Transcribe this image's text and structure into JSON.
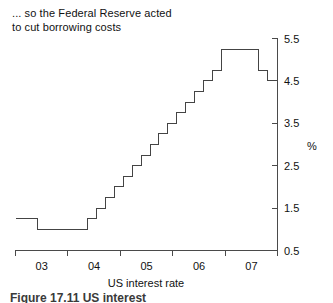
{
  "figure": {
    "title_line1": "... so the Federal Reserve acted",
    "title_line2": "to cut borrowing costs",
    "bottom_caption_fragment": "Figure 17.11   US interest"
  },
  "chart_data": {
    "type": "line",
    "step": true,
    "title": "... so the Federal Reserve acted to cut borrowing costs",
    "xlabel": "US interest rate",
    "ylabel": "%",
    "unit": "%",
    "xlim": [
      2002.5,
      2007.75
    ],
    "ylim": [
      0.5,
      5.5
    ],
    "xticks": [
      2002.5,
      2003.5,
      2004.5,
      2005.5,
      2006.5,
      2007.5
    ],
    "xtick_labels": [
      "03",
      "04",
      "05",
      "06",
      "07"
    ],
    "xtick_label_positions": [
      2003.0,
      2004.0,
      2005.0,
      2006.0,
      2007.0
    ],
    "yticks": [
      0.5,
      1.5,
      2.5,
      3.5,
      4.5,
      5.5
    ],
    "ytick_labels": [
      "0.5",
      "1.5",
      "2.5",
      "3.5",
      "4.5",
      "5.5"
    ],
    "grid": false,
    "legend": false,
    "series": [
      {
        "name": "US interest rate",
        "x": [
          2002.5,
          2002.95,
          2002.95,
          2003.95,
          2003.95,
          2004.13,
          2004.13,
          2004.31,
          2004.31,
          2004.48,
          2004.48,
          2004.66,
          2004.66,
          2004.84,
          2004.84,
          2005.02,
          2005.02,
          2005.2,
          2005.2,
          2005.37,
          2005.37,
          2005.55,
          2005.55,
          2005.73,
          2005.73,
          2005.91,
          2005.91,
          2006.09,
          2006.09,
          2006.26,
          2006.26,
          2006.44,
          2006.44,
          2006.62,
          2006.62,
          2007.36,
          2007.36,
          2007.55,
          2007.55,
          2007.72
        ],
        "y": [
          1.25,
          1.25,
          1.0,
          1.0,
          1.25,
          1.25,
          1.5,
          1.5,
          1.75,
          1.75,
          2.0,
          2.0,
          2.25,
          2.25,
          2.5,
          2.5,
          2.75,
          2.75,
          3.0,
          3.0,
          3.25,
          3.25,
          3.5,
          3.5,
          3.75,
          3.75,
          4.0,
          4.0,
          4.25,
          4.25,
          4.5,
          4.5,
          4.75,
          4.75,
          5.25,
          5.25,
          4.75,
          4.75,
          4.5,
          4.5
        ],
        "levels_description": [
          {
            "period": "early 2003",
            "rate": 1.25
          },
          {
            "period": "mid 2003 - mid 2004",
            "rate": 1.0
          },
          {
            "period": "2004 step increases",
            "rate_from": 1.25,
            "rate_to": 2.25
          },
          {
            "period": "2005 step increases",
            "rate_from": 2.5,
            "rate_to": 4.25
          },
          {
            "period": "2006 step increases",
            "rate_from": 4.5,
            "rate_to": 5.25
          },
          {
            "period": "mid 2006 - mid 2007 plateau",
            "rate": 5.25
          },
          {
            "period": "late 2007 first cut",
            "rate": 4.75
          },
          {
            "period": "late 2007 second cut",
            "rate": 4.5
          }
        ]
      }
    ]
  },
  "colors": {
    "line": "#444444",
    "axis": "#4a4a4a",
    "text": "#111111",
    "background": "#ffffff"
  }
}
